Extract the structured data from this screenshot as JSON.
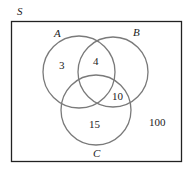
{
  "diagram": {
    "type": "venn",
    "universe_label": "S",
    "sets": [
      {
        "label": "A",
        "cx": 79,
        "cy": 72,
        "r": 36,
        "label_x": 57,
        "label_y": 37
      },
      {
        "label": "B",
        "cx": 113,
        "cy": 72,
        "r": 35,
        "label_x": 136,
        "label_y": 36
      },
      {
        "label": "C",
        "cx": 96,
        "cy": 110,
        "r": 35,
        "label_x": 96,
        "label_y": 157
      }
    ],
    "regions": [
      {
        "name": "A only",
        "value": "3",
        "x": 62,
        "y": 69
      },
      {
        "name": "A and B only",
        "value": "4",
        "x": 96,
        "y": 65
      },
      {
        "name": "B and C only",
        "value": "10",
        "x": 118,
        "y": 100
      },
      {
        "name": "C only",
        "value": "15",
        "x": 95,
        "y": 128
      },
      {
        "name": "outside all",
        "value": "100",
        "x": 157,
        "y": 126
      }
    ],
    "colors": {
      "rect": "#222222",
      "circle": "#7a7a7a",
      "text": "#222222"
    }
  }
}
